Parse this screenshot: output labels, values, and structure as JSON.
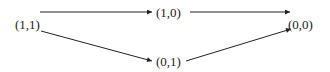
{
  "diagram": {
    "type": "directed-graph",
    "nodes": [
      {
        "id": "n11",
        "label": "(1,1)"
      },
      {
        "id": "n10",
        "label": "(1,0)"
      },
      {
        "id": "n01",
        "label": "(0,1)"
      },
      {
        "id": "n00",
        "label": "(0,0)"
      }
    ],
    "edges": [
      {
        "from": "(1,1)",
        "to": "(1,0)"
      },
      {
        "from": "(1,1)",
        "to": "(0,1)"
      },
      {
        "from": "(1,0)",
        "to": "(0,0)"
      },
      {
        "from": "(0,1)",
        "to": "(0,0)"
      }
    ],
    "colors": {
      "line": "#222222",
      "background": "#ffffff"
    }
  }
}
